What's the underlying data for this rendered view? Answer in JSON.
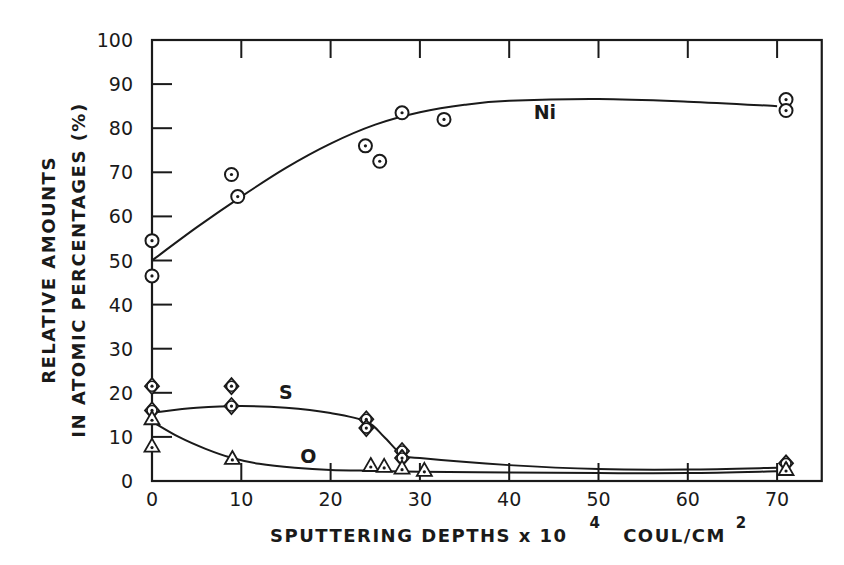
{
  "chart_data": {
    "type": "scatter",
    "title": "",
    "xlabel": "SPUTTERING DEPTHS x 10^4 COUL/CM^2",
    "xlabel_parts": {
      "main": "SPUTTERING DEPTHS x 10",
      "exp1": "4",
      "unit": "COUL/CM",
      "exp2": "2"
    },
    "ylabel": "RELATIVE AMOUNTS IN ATOMIC PERCENTAGES (%)",
    "ylabel_lines": [
      "RELATIVE   AMOUNTS",
      "IN ATOMIC PERCENTAGES  (%)"
    ],
    "xlim": [
      0,
      75
    ],
    "ylim": [
      0,
      100
    ],
    "x_ticks": [
      0,
      10,
      20,
      30,
      40,
      50,
      60,
      70
    ],
    "y_ticks": [
      0,
      10,
      20,
      30,
      40,
      50,
      60,
      70,
      80,
      90,
      100
    ],
    "grid": false,
    "legend": "inline labels",
    "series": [
      {
        "name": "Ni",
        "marker": "circle-dot",
        "label_pos": [
          44,
          82
        ],
        "points": [
          [
            0,
            54.5
          ],
          [
            0,
            46.5
          ],
          [
            8.9,
            69.5
          ],
          [
            9.6,
            64.5
          ],
          [
            23.9,
            76
          ],
          [
            25.5,
            72.5
          ],
          [
            28,
            83.5
          ],
          [
            32.7,
            82
          ],
          [
            71,
            86.5
          ],
          [
            71,
            84
          ]
        ],
        "curve": [
          [
            0,
            50
          ],
          [
            5,
            57.5
          ],
          [
            10,
            64.5
          ],
          [
            15,
            71
          ],
          [
            20,
            76.5
          ],
          [
            25,
            80.8
          ],
          [
            30,
            83.6
          ],
          [
            35,
            85.3
          ],
          [
            40,
            86.2
          ],
          [
            50,
            86.6
          ],
          [
            60,
            86
          ],
          [
            70,
            85
          ]
        ]
      },
      {
        "name": "S",
        "marker": "diamond-circle-dot",
        "label_pos": [
          15,
          18.5
        ],
        "points": [
          [
            0,
            21.5
          ],
          [
            0,
            16
          ],
          [
            8.9,
            21.5
          ],
          [
            8.9,
            17
          ],
          [
            24,
            14
          ],
          [
            24,
            12
          ],
          [
            28,
            6.8
          ],
          [
            28,
            5.2
          ],
          [
            71,
            4
          ]
        ],
        "curve": [
          [
            0,
            15.5
          ],
          [
            5,
            16.6
          ],
          [
            10,
            17
          ],
          [
            15,
            16.6
          ],
          [
            20,
            15.4
          ],
          [
            24,
            13.5
          ],
          [
            26,
            10
          ],
          [
            28,
            6
          ],
          [
            30,
            5.2
          ],
          [
            40,
            3.6
          ],
          [
            50,
            2.7
          ],
          [
            60,
            2.6
          ],
          [
            70,
            3
          ]
        ]
      },
      {
        "name": "O",
        "marker": "triangle-dot",
        "label_pos": [
          17.5,
          4
        ],
        "points": [
          [
            0,
            14
          ],
          [
            0,
            7.8
          ],
          [
            9,
            5
          ],
          [
            24.5,
            3.4
          ],
          [
            26,
            3.2
          ],
          [
            28,
            2.8
          ],
          [
            30.5,
            2.3
          ],
          [
            71,
            2.5
          ]
        ],
        "curve": [
          [
            0,
            13.5
          ],
          [
            3,
            10
          ],
          [
            6,
            7.3
          ],
          [
            9,
            5.2
          ],
          [
            12,
            3.9
          ],
          [
            16,
            3
          ],
          [
            20,
            2.5
          ],
          [
            25,
            2.3
          ],
          [
            30,
            2.1
          ],
          [
            40,
            1.9
          ],
          [
            50,
            1.8
          ],
          [
            60,
            1.8
          ],
          [
            70,
            2.2
          ]
        ]
      }
    ]
  }
}
